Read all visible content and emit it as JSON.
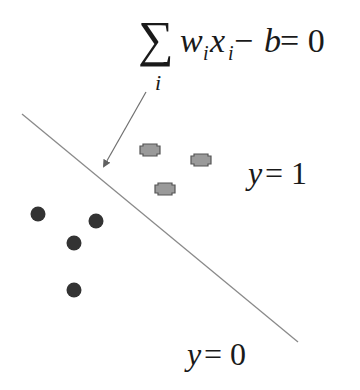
{
  "diagram": {
    "equation": {
      "sum_symbol": "∑",
      "sum_index": "i",
      "w": "w",
      "w_sub": "i",
      "x": "x",
      "x_sub": "i",
      "rest": " − ",
      "b": "b",
      "equals": " = 0"
    },
    "labels": {
      "class_one": {
        "var": "y",
        "eq": " = 1"
      },
      "class_zero": {
        "var": "y",
        "eq": " = 0"
      }
    },
    "boundary_line": {
      "x1": 22,
      "y1": 114,
      "x2": 298,
      "y2": 342,
      "color": "#8a8a8a"
    },
    "arrow": {
      "x1": 146,
      "y1": 92,
      "x2": 104,
      "y2": 166,
      "color": "#707070"
    },
    "class_one_points": [
      {
        "x": 150,
        "y": 150
      },
      {
        "x": 201,
        "y": 160
      },
      {
        "x": 165,
        "y": 189
      }
    ],
    "class_zero_points": [
      {
        "x": 38,
        "y": 214
      },
      {
        "x": 96,
        "y": 221
      },
      {
        "x": 74,
        "y": 243
      },
      {
        "x": 74,
        "y": 290
      }
    ],
    "colors": {
      "class_one_fill": "#9a9a9a",
      "class_one_stroke": "#555555",
      "class_zero_fill": "#333333",
      "text": "#1a1a1a"
    }
  }
}
